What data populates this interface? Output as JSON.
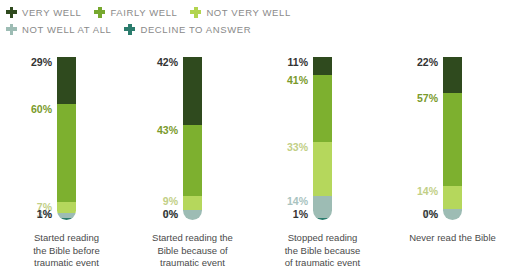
{
  "legend": {
    "rows": [
      [
        {
          "label": "VERY WELL",
          "color": "#2f4a1e",
          "icon": "plus-cross-icon"
        },
        {
          "label": "FAIRLY WELL",
          "color": "#76a82e",
          "icon": "plus-cross-icon"
        },
        {
          "label": "NOT VERY WELL",
          "color": "#b2d44f",
          "icon": "plus-cross-icon"
        }
      ],
      [
        {
          "label": "NOT WELL AT ALL",
          "color": "#9dbcb4",
          "icon": "plus-cross-icon"
        },
        {
          "label": "DECLINE TO ANSWER",
          "color": "#2b7c6d",
          "icon": "plus-cross-icon"
        }
      ]
    ]
  },
  "chart_data": {
    "type": "bar",
    "title": "",
    "xlabel": "",
    "ylabel": "",
    "ylim": [
      0,
      100
    ],
    "grid": false,
    "stacked": true,
    "legend_position": "top-left",
    "categories": [
      "Started reading the Bible before traumatic event",
      "Started reading the Bible because of traumatic event",
      "Stopped reading the Bible because of traumatic event",
      "Never read the Bible"
    ],
    "series": [
      {
        "name": "VERY WELL",
        "color": "#2f4a1e",
        "label_color": "#333333",
        "values": [
          29,
          42,
          11,
          22
        ]
      },
      {
        "name": "FAIRLY WELL",
        "color": "#7db02f",
        "label_color": "#7a9a2b",
        "values": [
          60,
          43,
          41,
          57
        ]
      },
      {
        "name": "NOT VERY WELL",
        "color": "#b5d75c",
        "label_color": "#c2cf86",
        "values": [
          7,
          9,
          33,
          14
        ]
      },
      {
        "name": "NOT WELL AT ALL",
        "color": "#9dbcb4",
        "label_color": "#a9c3c0",
        "values": [
          3,
          6,
          14,
          7
        ]
      },
      {
        "name": "DECLINE TO ANSWER",
        "color": "#2b7c6d",
        "label_color": "#333333",
        "values": [
          1,
          0,
          1,
          0
        ]
      }
    ],
    "value_labels": [
      [
        "29%",
        "60%",
        "7%",
        "3%",
        "1%"
      ],
      [
        "42%",
        "43%",
        "9%",
        "6%",
        "0%"
      ],
      [
        "11%",
        "41%",
        "33%",
        "14%",
        "1%"
      ],
      [
        "22%",
        "57%",
        "14%",
        "7%",
        "0%"
      ]
    ]
  },
  "captions": [
    "Started reading\nthe Bible before\ntraumatic event",
    "Started reading the\nBible because of\ntraumatic event",
    "Stopped reading\nthe Bible because\nof traumatic event",
    "Never read the Bible"
  ]
}
